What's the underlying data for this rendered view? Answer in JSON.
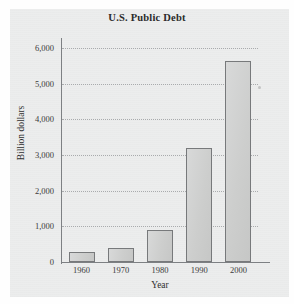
{
  "chart_data": {
    "type": "bar",
    "title": "U.S. Public Debt",
    "xlabel": "Year",
    "ylabel": "Billion dollars",
    "categories": [
      "1960",
      "1970",
      "1980",
      "1990",
      "2000"
    ],
    "values": [
      290,
      380,
      910,
      3200,
      5630
    ],
    "ylim": [
      0,
      6000
    ],
    "ytick_values": [
      0,
      1000,
      2000,
      3000,
      4000,
      5000,
      6000
    ],
    "ytick_labels": [
      "0",
      "1,000",
      "2,000",
      "3,000",
      "4,000",
      "5,000",
      "6,000"
    ],
    "grid": "horizontal-dotted",
    "legend": null,
    "bar_fill_color": "#d2d3d2",
    "bar_border_color": "#77797b",
    "plot_background_color": "#eceded",
    "axis_color": "#7d8083",
    "gridline_color": "#a9abad"
  }
}
